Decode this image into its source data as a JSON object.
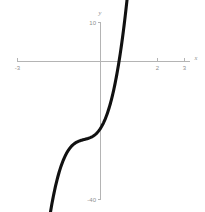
{
  "chart_data": {
    "type": "line",
    "title": "",
    "subtitle": "",
    "xlabel": "x",
    "ylabel": "y",
    "xlim": [
      -3,
      3
    ],
    "ylim": [
      -40,
      10
    ],
    "grid": false,
    "legend": null,
    "x_ticks": [
      {
        "value": -3,
        "label": "-3"
      },
      {
        "value": 2,
        "label": "2"
      },
      {
        "value": 3,
        "label": "3"
      }
    ],
    "y_ticks": [
      {
        "value": 10,
        "label": "10"
      },
      {
        "value": -40,
        "label": "-40"
      }
    ],
    "series": [
      {
        "name": "cubic-curve",
        "color": "#111111",
        "x": [
          -2.22,
          -2.0,
          -1.8,
          -1.6,
          -1.4,
          -1.2,
          -1.0,
          -0.8,
          -0.6,
          -0.4,
          -0.2,
          0.0,
          0.2,
          0.4,
          0.6,
          0.8,
          1.0,
          1.2,
          1.4,
          1.55
        ],
        "y": [
          -56.0,
          -46.0,
          -38.4,
          -32.0,
          -27.2,
          -24.0,
          -22.4,
          -21.8,
          -21.6,
          -21.8,
          -22.4,
          -23.0,
          -22.8,
          -21.4,
          -18.4,
          -13.2,
          -5.6,
          4.0,
          1.0,
          10.0
        ]
      }
    ],
    "annotations": []
  },
  "axes": {
    "x_axis_name": "x",
    "y_axis_name": "y"
  }
}
